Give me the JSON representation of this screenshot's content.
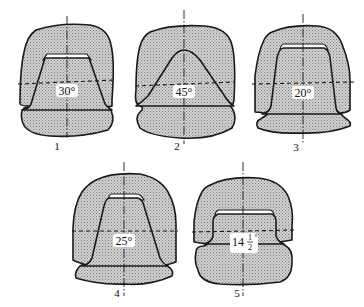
{
  "figure": {
    "items": [
      {
        "number": "1",
        "angle": "30°"
      },
      {
        "number": "2",
        "angle": "45°"
      },
      {
        "number": "3",
        "angle": "20°"
      },
      {
        "number": "4",
        "angle": "25°"
      },
      {
        "number": "5",
        "angle": "14½°",
        "angle_whole": "14",
        "angle_fraction_num": "1",
        "angle_fraction_den": "2",
        "angle_degree": "°"
      }
    ]
  },
  "colors": {
    "stroke": "#1a1a1a",
    "fill": "#c8c8c8",
    "background": "#ffffff"
  }
}
